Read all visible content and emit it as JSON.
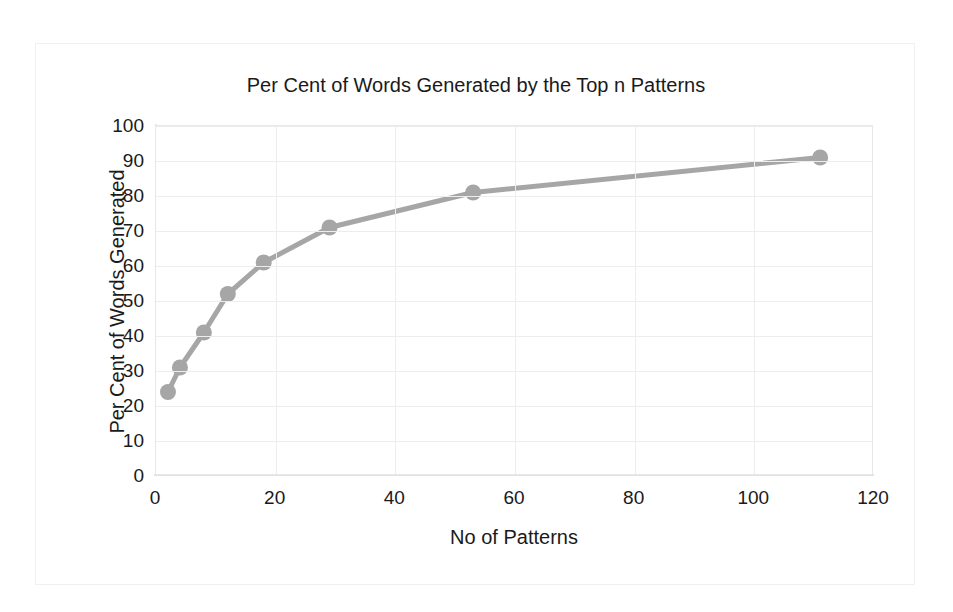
{
  "chart_data": {
    "type": "line",
    "title": "Per Cent of Words Generated by the Top n Patterns",
    "xlabel": "No of Patterns",
    "ylabel": "Per Cent of Words Generated",
    "x": [
      2,
      4,
      8,
      12,
      18,
      29,
      53,
      111
    ],
    "values": [
      24,
      31,
      41,
      52,
      61,
      71,
      81,
      91
    ],
    "series": [
      {
        "name": "Per Cent of Words Generated",
        "x": [
          2,
          4,
          8,
          12,
          18,
          29,
          53,
          111
        ],
        "values": [
          24,
          31,
          41,
          52,
          61,
          71,
          81,
          91
        ]
      }
    ],
    "xlim": [
      0,
      120
    ],
    "ylim": [
      0,
      100
    ],
    "xticks": [
      0,
      20,
      40,
      60,
      80,
      100,
      120
    ],
    "yticks": [
      0,
      10,
      20,
      30,
      40,
      50,
      60,
      70,
      80,
      90,
      100
    ],
    "xtick_labels": [
      "0",
      "20",
      "40",
      "60",
      "80",
      "100",
      "120"
    ],
    "ytick_labels": [
      "0",
      "10",
      "20",
      "30",
      "40",
      "50",
      "60",
      "70",
      "80",
      "90",
      "100"
    ],
    "grid": true,
    "legend": false,
    "legend_position": "none",
    "markers": true,
    "marker_shape": "circle",
    "colors": {
      "line": "#A6A6A6",
      "marker": "#A6A6A6",
      "grid": "#EDEDED",
      "axis": "#E2E2E2",
      "text": "#1A1A1A",
      "background": "#FFFFFF",
      "frame": "#F0F0F0"
    }
  }
}
